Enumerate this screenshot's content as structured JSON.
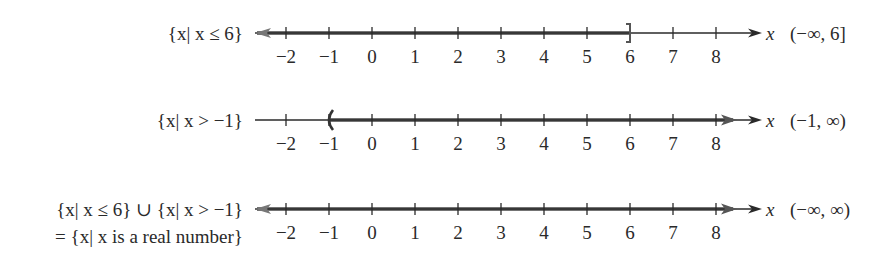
{
  "figure": {
    "axis_variable": "x",
    "tick_values": [
      -2,
      -1,
      0,
      1,
      2,
      3,
      4,
      5,
      6,
      7,
      8
    ],
    "tick_labels": [
      "−2",
      "−1",
      "0",
      "1",
      "2",
      "3",
      "4",
      "5",
      "6",
      "7",
      "8"
    ],
    "colors": {
      "axis": "#2a2a2a",
      "shaded_ray": "#333333",
      "text": "#2a2a2a",
      "background": "#ffffff"
    }
  },
  "rows": [
    {
      "set_label": "{x| x ≤ 6}",
      "set_label_line2": "",
      "interval": "(−∞, 6]",
      "shaded_from": "-inf",
      "shaded_to": 6,
      "left_endpoint": "none",
      "right_endpoint": "]",
      "right_endpoint_type": "closed bracket"
    },
    {
      "set_label": "{x| x > −1}",
      "set_label_line2": "",
      "interval": "(−1, ∞)",
      "shaded_from": -1,
      "shaded_to": "inf",
      "left_endpoint": "(",
      "left_endpoint_type": "open parenthesis",
      "right_endpoint": "none"
    },
    {
      "set_label": "{x| x ≤ 6} ∪ {x| x > −1}",
      "set_label_line2": "= {x| x is a real number}",
      "interval": "(−∞, ∞)",
      "shaded_from": "-inf",
      "shaded_to": "inf",
      "left_endpoint": "none",
      "right_endpoint": "none"
    }
  ]
}
